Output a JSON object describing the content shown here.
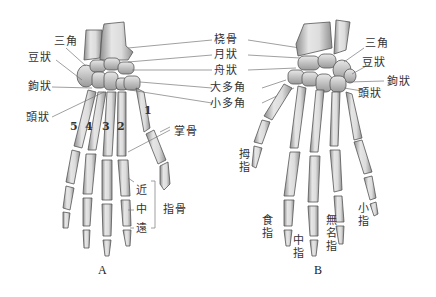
{
  "figure": {
    "panels": [
      {
        "id": "A",
        "caption": "A",
        "view": "palmar"
      },
      {
        "id": "B",
        "caption": "B",
        "view": "dorsal"
      }
    ],
    "center_labels": [
      "桡骨",
      "月狀",
      "舟狀",
      "大多角",
      "小多角"
    ],
    "panel_a": {
      "labels": {
        "triquetral": "三角",
        "pisiform": "豆狀",
        "hamate": "鉤狀",
        "capitate": "頭狀",
        "metacarpal": "掌骨",
        "proximal": "近",
        "middle": "中",
        "distal": "遠",
        "phalanges": "指骨"
      },
      "digit_numbers": [
        "5",
        "4",
        "3",
        "2",
        "1"
      ]
    },
    "panel_b": {
      "labels": {
        "triquetral": "三角",
        "pisiform": "豆狀",
        "hamate": "鉤狀",
        "capitate": "頭狀",
        "thumb": "拇指",
        "index": "食指",
        "middle_finger": "中指",
        "ring": "無名指",
        "little": "小指"
      }
    },
    "colors": {
      "bone_fill": "#d9d9d9",
      "bone_shade": "#8a8a8a",
      "bone_outline": "#555555",
      "leader_line": "#777777",
      "text": "#333333"
    }
  }
}
